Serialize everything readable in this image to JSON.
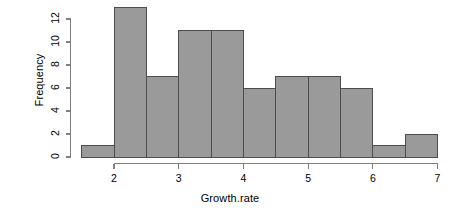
{
  "chart_data": {
    "type": "bar",
    "subtype": "histogram",
    "title": "",
    "xlabel": "Growth.rate",
    "ylabel": "Frequency",
    "bin_width": 0.5,
    "bin_edges": [
      1.5,
      2.0,
      2.5,
      3.0,
      3.5,
      4.0,
      4.5,
      5.0,
      5.5,
      6.0,
      6.5,
      7.0
    ],
    "categories": [
      "1.5-2.0",
      "2.0-2.5",
      "2.5-3.0",
      "3.0-3.5",
      "3.5-4.0",
      "4.0-4.5",
      "4.5-5.0",
      "5.0-5.5",
      "5.5-6.0",
      "6.0-6.5",
      "6.5-7.0"
    ],
    "values": [
      1,
      13,
      7,
      11,
      11,
      6,
      7,
      7,
      6,
      1,
      2
    ],
    "xlim": [
      1.5,
      7.0
    ],
    "ylim": [
      0,
      13
    ],
    "xticks": [
      2,
      3,
      4,
      5,
      6,
      7
    ],
    "xtick_labels": [
      "2",
      "3",
      "4",
      "5",
      "6",
      "7"
    ],
    "yticks": [
      0,
      2,
      4,
      6,
      8,
      10,
      12
    ],
    "ytick_labels": [
      "0",
      "2",
      "4",
      "6",
      "8",
      "10",
      "12"
    ],
    "grid": false,
    "legend": false,
    "bar_fill_color": "#9a9a9a",
    "bar_border_color": "#4d4d4d",
    "axis_color": "#808080"
  },
  "axes": {
    "y_title": "Frequency",
    "x_title": "Growth.rate"
  }
}
